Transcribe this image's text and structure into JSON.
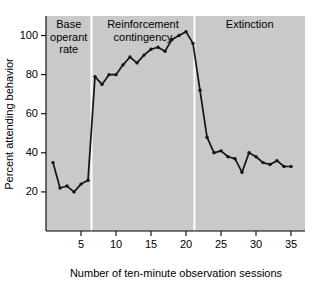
{
  "chart_data": {
    "type": "line",
    "title": "",
    "xlabel": "Number of ten-minute observation sessions",
    "ylabel": "Percent attending behavior",
    "xlim": [
      0,
      37
    ],
    "ylim": [
      0,
      110
    ],
    "grid": false,
    "legend": "none",
    "xticks": [
      5,
      10,
      15,
      20,
      25,
      30,
      35
    ],
    "yticks": [
      20,
      40,
      60,
      80,
      100
    ],
    "x": [
      1,
      2,
      3,
      4,
      5,
      6,
      7,
      8,
      9,
      10,
      11,
      12,
      13,
      14,
      15,
      16,
      17,
      18,
      19,
      20,
      21,
      22,
      23,
      24,
      25,
      26,
      27,
      28,
      29,
      30,
      31,
      32,
      33,
      34,
      35
    ],
    "values": [
      35,
      22,
      23,
      20,
      24,
      26,
      79,
      75,
      80,
      80,
      85,
      89,
      86,
      90,
      93,
      94,
      92,
      98,
      100,
      102,
      96,
      72,
      48,
      40,
      41,
      38,
      37,
      30,
      40,
      38,
      35,
      34,
      36,
      33,
      33
    ],
    "series": [
      {
        "name": "Percent attending behavior",
        "values": [
          35,
          22,
          23,
          20,
          24,
          26,
          79,
          75,
          80,
          80,
          85,
          89,
          86,
          90,
          93,
          94,
          92,
          98,
          100,
          102,
          96,
          72,
          48,
          40,
          41,
          38,
          37,
          30,
          40,
          38,
          35,
          34,
          36,
          33,
          33
        ]
      }
    ],
    "phases": [
      {
        "label": "Base\noperant\nrate",
        "label_lines": [
          "Base",
          "operant",
          "rate"
        ],
        "x_start": 0,
        "x_end": 6.5
      },
      {
        "label": "Reinforcement\ncontingency",
        "label_lines": [
          "Reinforcement",
          "contingency"
        ],
        "x_start": 6.5,
        "x_end": 21.2
      },
      {
        "label": "Extinction",
        "label_lines": [
          "Extinction"
        ],
        "x_start": 21.2,
        "x_end": 37
      }
    ],
    "phase_divider_x": [
      6.5,
      21.2
    ],
    "colors": {
      "plot_background": "#c9c9c9",
      "line": "#141414",
      "divider": "#ffffff",
      "axis": "#000000",
      "page_background": "#ffffff"
    }
  }
}
